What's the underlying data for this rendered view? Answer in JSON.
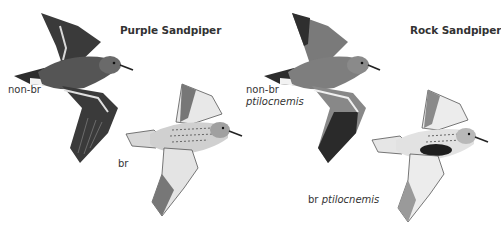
{
  "plate": {
    "species": [
      {
        "name": "Purple Sandpiper",
        "figures": [
          {
            "label": "non-br",
            "subspecies": ""
          },
          {
            "label": "br",
            "subspecies": ""
          }
        ]
      },
      {
        "name": "Rock Sandpiper",
        "figures": [
          {
            "label": "non-br",
            "subspecies": "ptilocnemis"
          },
          {
            "label": "br",
            "subspecies": "ptilocnemis"
          }
        ]
      }
    ]
  }
}
